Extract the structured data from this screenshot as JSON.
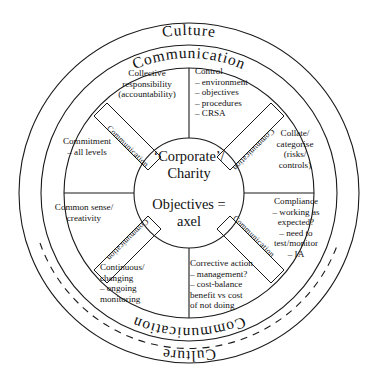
{
  "diagram": {
    "rings": {
      "outer_label_top": "Culture",
      "outer_label_bottom": "Culture",
      "middle_label_top": "Communication",
      "middle_label_bottom": "Communication"
    },
    "hub": {
      "line1": "‘Corporate’/",
      "line2": "Charity",
      "line3": "Objectives =",
      "line4": "axel"
    },
    "spokes": [
      {
        "id": "spoke-upper-left",
        "label": "Communication"
      },
      {
        "id": "spoke-upper-right",
        "label": "Communication"
      },
      {
        "id": "spoke-lower-right",
        "label": "Communication"
      },
      {
        "id": "spoke-lower-left",
        "label": "Communication"
      }
    ],
    "sectors": [
      {
        "id": "collective-responsibility",
        "lines": [
          "Collective",
          "responsibility",
          "(accountability)"
        ],
        "align": "center"
      },
      {
        "id": "control",
        "lines": [
          "Control",
          "– environment",
          "– objectives",
          "– procedures",
          "– CRSA"
        ],
        "align": "left"
      },
      {
        "id": "commitment",
        "lines": [
          "Commitment",
          "– all levels"
        ],
        "align": "center"
      },
      {
        "id": "collate-categorise",
        "lines": [
          "Collate/",
          "categorise",
          "(risks/",
          "controls)"
        ],
        "align": "center"
      },
      {
        "id": "common-sense",
        "lines": [
          "Common sense/",
          "creativity"
        ],
        "align": "center"
      },
      {
        "id": "compliance",
        "lines": [
          "Compliance",
          "– working as",
          "expected?",
          "– need to",
          "test/monitor",
          "– IA"
        ],
        "align": "center"
      },
      {
        "id": "continuous-changing",
        "lines": [
          "Continuous/",
          "changing",
          "– ongoing",
          "monitoring"
        ],
        "align": "left"
      },
      {
        "id": "corrective-action",
        "lines": [
          "Corrective action",
          "– management?",
          "– cost-balance",
          "benefit vs cost",
          "of not doing"
        ],
        "align": "left"
      }
    ],
    "colors": {
      "stroke": "#1a1a1a",
      "background": "#ffffff",
      "text": "#111111"
    }
  }
}
